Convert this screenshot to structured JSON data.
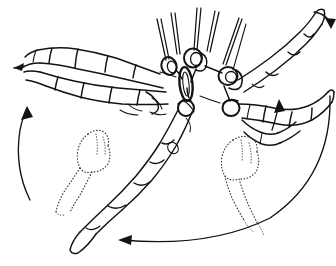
{
  "figure": {
    "title": "Arachnid leg movement diagram",
    "style": "ink-line-drawing",
    "background_color": "#ffffff",
    "ink_color": "#15120f",
    "ghost_color": "#35302c",
    "width": 336,
    "height": 266,
    "caption": ""
  },
  "anatomy": {
    "body": {
      "name": "central-body",
      "sternum_label": "",
      "description": "sternum-oval"
    },
    "coxal_rings": [
      {
        "name": "coxa-ring-left-outer",
        "cx": 172,
        "cy": 64
      },
      {
        "name": "coxa-ring-left-inner",
        "cx": 187,
        "cy": 58
      },
      {
        "name": "coxa-ring-center",
        "cx": 201,
        "cy": 57
      },
      {
        "name": "coxa-ring-right-inner",
        "cx": 226,
        "cy": 73
      },
      {
        "name": "coxa-ring-right-outer",
        "cx": 236,
        "cy": 76
      },
      {
        "name": "coxa-ring-lower-left",
        "cx": 185,
        "cy": 101
      },
      {
        "name": "coxa-ring-lower-right",
        "cx": 232,
        "cy": 106
      }
    ],
    "setae": [
      {
        "name": "seta-1",
        "x1": 166,
        "y1": 58,
        "x2": 158,
        "y2": 20
      },
      {
        "name": "seta-2",
        "x1": 176,
        "y1": 53,
        "x2": 172,
        "y2": 14
      },
      {
        "name": "seta-3",
        "x1": 194,
        "y1": 49,
        "x2": 198,
        "y2": 8
      },
      {
        "name": "seta-4",
        "x1": 207,
        "y1": 50,
        "x2": 216,
        "y2": 12
      },
      {
        "name": "seta-5",
        "x1": 222,
        "y1": 63,
        "x2": 240,
        "y2": 18
      },
      {
        "name": "seta-6",
        "x1": 232,
        "y1": 68,
        "x2": 245,
        "y2": 22
      }
    ],
    "legs": [
      {
        "name": "leg-left-anterior",
        "direction": "extends-left",
        "segments": 5,
        "tip": "claw-left"
      },
      {
        "name": "leg-left-secondary",
        "direction": "extends-left-lower",
        "segments": 4,
        "tip": ""
      },
      {
        "name": "leg-center-descending",
        "direction": "extends-down-left",
        "segments": 5,
        "tip": "tarsus-claw"
      },
      {
        "name": "leg-right-anterior",
        "direction": "extends-up-right",
        "segments": 4,
        "tip": "claw-upper-right"
      },
      {
        "name": "leg-right-posterior",
        "direction": "extends-right",
        "segments": 4,
        "tip": "claw-right"
      }
    ],
    "ghost_legs": [
      {
        "name": "ghost-leg-left",
        "note": "alternate-position-left"
      },
      {
        "name": "ghost-leg-right",
        "note": "alternate-position-right"
      }
    ]
  },
  "arrows": [
    {
      "name": "arrow-left-tip",
      "label": "",
      "kind": "straight-short",
      "points_to": "left",
      "description": "small arrowhead at left leg tip"
    },
    {
      "name": "arrow-left-sweep",
      "label": "",
      "kind": "curved-long",
      "points_to": "up",
      "description": "long curved arrow sweeping upward on the left"
    },
    {
      "name": "arrow-right-up",
      "label": "",
      "kind": "straight",
      "points_to": "up",
      "description": "vertical arrow on the right side pointing up"
    },
    {
      "name": "arrow-upper-right-curve",
      "label": "",
      "kind": "curved-short",
      "points_to": "down-right",
      "description": "small curved arrow at upper right curving clockwise"
    },
    {
      "name": "arrow-bottom-sweep",
      "label": "",
      "kind": "curved-long",
      "points_to": "left",
      "description": "long curved arrow along the bottom pointing left"
    }
  ]
}
